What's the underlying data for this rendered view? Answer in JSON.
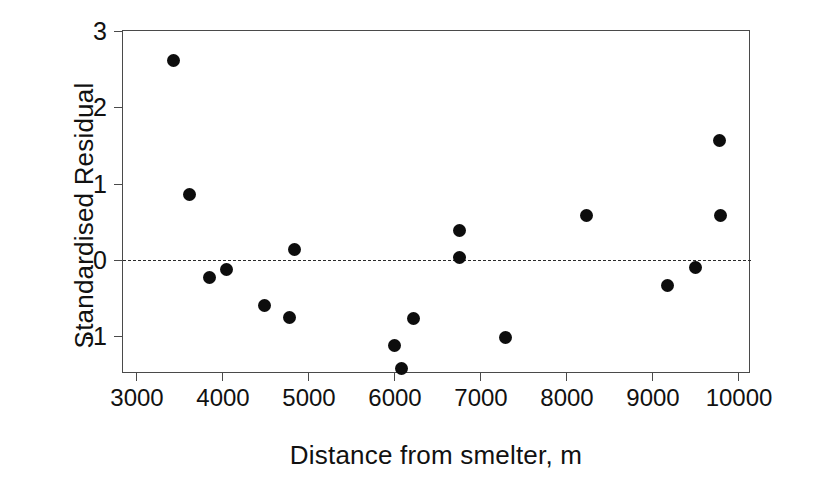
{
  "chart_data": {
    "type": "scatter",
    "title": "",
    "xlabel": "Distance from smelter, m",
    "ylabel": "Standardised Residual",
    "xlim": [
      3000,
      10000
    ],
    "ylim": [
      -1.75,
      3.0
    ],
    "xticks": [
      3000,
      4000,
      5000,
      6000,
      7000,
      8000,
      9000,
      10000
    ],
    "xtick_labels": [
      "3000",
      "4000",
      "5000",
      "6000",
      "7000",
      "8000",
      "9000",
      "10000"
    ],
    "yticks": [
      3,
      2,
      1,
      0,
      -1
    ],
    "ytick_labels": [
      "3",
      "2",
      "1",
      "0",
      "-1"
    ],
    "grid": false,
    "legend": false,
    "reference_lines": [
      {
        "axis": "y",
        "value": 0,
        "style": "dashed",
        "color": "#2b2b2b"
      }
    ],
    "marker": {
      "shape": "circle",
      "color": "#0d0d0d",
      "size": 13
    },
    "x": [
      3440,
      3620,
      3860,
      4050,
      4490,
      4780,
      4840,
      6010,
      6090,
      6230,
      6760,
      6760,
      7300,
      8240,
      9180,
      9500,
      9790,
      9800
    ],
    "y": [
      2.62,
      0.86,
      -0.23,
      -0.12,
      -0.6,
      -0.76,
      0.14,
      -1.12,
      -1.42,
      -0.77,
      0.39,
      0.03,
      -1.02,
      0.58,
      -0.34,
      -0.1,
      1.56,
      0.58
    ],
    "points": [
      {
        "x": 3440,
        "y": 2.62
      },
      {
        "x": 3620,
        "y": 0.86
      },
      {
        "x": 3860,
        "y": -0.23
      },
      {
        "x": 4050,
        "y": -0.12
      },
      {
        "x": 4490,
        "y": -0.6
      },
      {
        "x": 4780,
        "y": -0.76
      },
      {
        "x": 4840,
        "y": 0.14
      },
      {
        "x": 6010,
        "y": -1.12
      },
      {
        "x": 6090,
        "y": -1.42
      },
      {
        "x": 6230,
        "y": -0.77
      },
      {
        "x": 6760,
        "y": 0.39
      },
      {
        "x": 6760,
        "y": 0.03
      },
      {
        "x": 7300,
        "y": -1.02
      },
      {
        "x": 8240,
        "y": 0.58
      },
      {
        "x": 9180,
        "y": -0.34
      },
      {
        "x": 9500,
        "y": -0.1
      },
      {
        "x": 9790,
        "y": 1.56
      },
      {
        "x": 9800,
        "y": 0.58
      }
    ]
  }
}
